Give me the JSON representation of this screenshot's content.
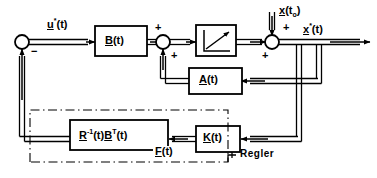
{
  "diagram": {
    "language": "de",
    "stroke_color": "#000000",
    "background_color": "#ffffff",
    "blocks": [
      {
        "id": "B",
        "label_main": "B",
        "label_sup": "",
        "label_arg": "(t)",
        "underline": true,
        "x": 95,
        "y": 26,
        "w": 52,
        "h": 30
      },
      {
        "id": "INT",
        "label_main": "",
        "symbol": "integrator-ramp",
        "x": 196,
        "y": 25,
        "w": 40,
        "h": 31
      },
      {
        "id": "A",
        "label_main": "A",
        "label_sup": "",
        "label_arg": "(t)",
        "underline": true,
        "x": 189,
        "y": 68,
        "w": 53,
        "h": 26
      },
      {
        "id": "RB",
        "label_main": "R",
        "label_sup": "-1",
        "label_arg": "(t)",
        "label_main2": "B",
        "label_sup2": "T",
        "label_arg2": "(t)",
        "underline": true,
        "x": 70,
        "y": 120,
        "w": 98,
        "h": 30
      },
      {
        "id": "K",
        "label_main": "K",
        "label_sup": "",
        "label_arg": "(t)",
        "underline": true,
        "x": 196,
        "y": 126,
        "w": 44,
        "h": 26
      }
    ],
    "summing_junctions": [
      {
        "id": "sum1",
        "cx": 22,
        "cy": 42,
        "r": 7
      },
      {
        "id": "sum2",
        "cx": 163,
        "cy": 42,
        "r": 7
      },
      {
        "id": "sum3",
        "cx": 272,
        "cy": 42,
        "r": 7
      }
    ],
    "signs": [
      {
        "id": "sum1-minus",
        "text": "−",
        "x": 31,
        "y": 46
      },
      {
        "id": "sum2-plus-top",
        "text": "+",
        "x": 155,
        "y": 22
      },
      {
        "id": "sum2-plus-bottom",
        "text": "+",
        "x": 171,
        "y": 50
      },
      {
        "id": "sum3-plus-top",
        "text": "+",
        "x": 283,
        "y": 22
      },
      {
        "id": "sum3-plus-bottom",
        "text": "+",
        "x": 262,
        "y": 50
      }
    ],
    "signals": {
      "input_u": {
        "main": "u",
        "sup": "*",
        "arg": "(t)",
        "x": 47,
        "y": 17
      },
      "initial_state": {
        "main": "x",
        "sup": "",
        "arg": "(t",
        "sub": "o",
        "argclose": ")",
        "x": 266,
        "y": 5
      },
      "output_x": {
        "main": "x",
        "sup": "*",
        "arg": "(t)",
        "x": 303,
        "y": 22
      },
      "feedback_F": {
        "main": "F",
        "sup": "",
        "arg": "(t)",
        "x": 153,
        "y": 146
      }
    },
    "annotations": {
      "regler": {
        "label": "Regler",
        "x": 270,
        "y": 154
      }
    },
    "dashdot_box": {
      "x": 30,
      "y": 110,
      "w": 198,
      "h": 52
    }
  }
}
